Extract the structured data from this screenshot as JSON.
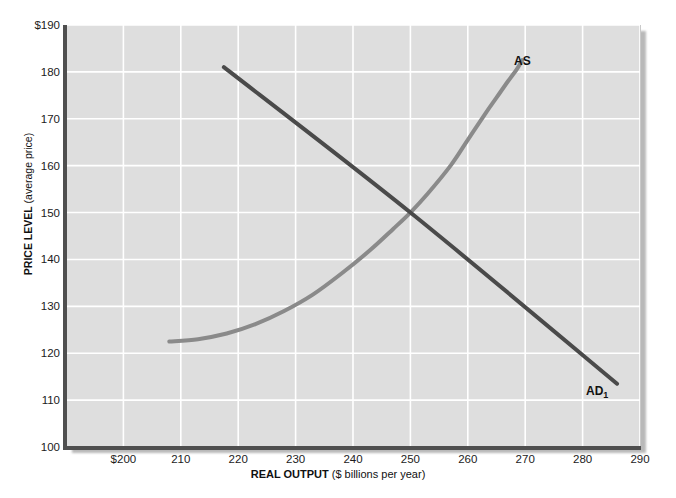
{
  "chart_data": {
    "type": "line",
    "title": "",
    "xlabel_strong": "REAL OUTPUT",
    "xlabel_rest": " ($ billions per year)",
    "ylabel_strong": "PRICE LEVEL",
    "ylabel_rest": " (average price)",
    "xlim": [
      190,
      290
    ],
    "ylim": [
      100,
      190
    ],
    "grid": true,
    "legend_position": "inline-curve-labels",
    "x_ticks": [
      "$200",
      "210",
      "220",
      "230",
      "240",
      "250",
      "260",
      "270",
      "280",
      "290"
    ],
    "x_tick_values": [
      200,
      210,
      220,
      230,
      240,
      250,
      260,
      270,
      280,
      290
    ],
    "y_ticks": [
      "$190",
      "180",
      "170",
      "160",
      "150",
      "140",
      "130",
      "120",
      "110",
      "100"
    ],
    "y_tick_values": [
      190,
      180,
      170,
      160,
      150,
      140,
      130,
      120,
      110,
      100
    ],
    "equilibrium": {
      "x": 250,
      "y": 150
    },
    "series": [
      {
        "name": "AS",
        "label": "AS",
        "color": "#8a8a8a",
        "line_width": 4,
        "description": "upward-sloping aggregate supply curve, convex and steepening",
        "points": [
          [
            208,
            122.5
          ],
          [
            213,
            123.0
          ],
          [
            218,
            124.2
          ],
          [
            223,
            126.2
          ],
          [
            228,
            129.0
          ],
          [
            233,
            132.5
          ],
          [
            238,
            137.0
          ],
          [
            243,
            142.0
          ],
          [
            247,
            146.5
          ],
          [
            250,
            150.0
          ],
          [
            253,
            154.0
          ],
          [
            257,
            160.0
          ],
          [
            260,
            165.5
          ],
          [
            263,
            171.0
          ],
          [
            265,
            174.5
          ],
          [
            267,
            178.0
          ],
          [
            268.5,
            180.5
          ],
          [
            269.5,
            182.5
          ]
        ]
      },
      {
        "name": "AD1",
        "label": "AD",
        "label_sub": "1",
        "color": "#4a4a4a",
        "line_width": 4,
        "description": "downward-sloping aggregate demand curve, straight line",
        "points": [
          [
            217.5,
            181.0
          ],
          [
            250,
            150.0
          ],
          [
            286,
            113.5
          ]
        ]
      }
    ],
    "colors": {
      "plot_background": "#dedede",
      "gridline": "#ffffff",
      "axis": "#4f4f4f",
      "page_background": "#ffffff",
      "as_curve": "#8a8a8a",
      "ad_curve": "#4a4a4a",
      "text": "#1b1b1b"
    }
  }
}
